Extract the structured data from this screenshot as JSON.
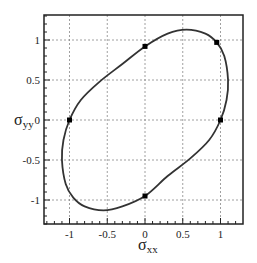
{
  "chart_data": {
    "type": "line",
    "title": "",
    "xlabel": "σxx",
    "ylabel": "σyy",
    "xlabel_main": "σ",
    "xlabel_sub": "xx",
    "ylabel_main": "σ",
    "ylabel_sub": "yy",
    "xlim": [
      -1.3,
      1.3
    ],
    "ylim": [
      -1.3,
      1.3
    ],
    "grid": true,
    "legend": null,
    "xticks": [
      -1,
      -0.5,
      0,
      0.5,
      1
    ],
    "xtick_labels": [
      "-1",
      "-0.5",
      "0",
      "0.5",
      "1"
    ],
    "yticks": [
      1,
      0.5,
      0,
      -0.5,
      -1
    ],
    "ytick_labels": [
      "1",
      "0.5",
      "0",
      "-0.5",
      "-1"
    ],
    "series": [
      {
        "name": "stress-ellipse",
        "kind": "closed-curve",
        "color": "#333333",
        "points": [
          [
            1.0,
            0.0
          ],
          [
            1.08,
            0.25
          ],
          [
            1.1,
            0.5
          ],
          [
            1.05,
            0.8
          ],
          [
            0.95,
            0.97
          ],
          [
            0.8,
            1.08
          ],
          [
            0.55,
            1.13
          ],
          [
            0.3,
            1.08
          ],
          [
            0.0,
            0.92
          ],
          [
            -0.3,
            0.7
          ],
          [
            -0.6,
            0.48
          ],
          [
            -0.85,
            0.25
          ],
          [
            -1.0,
            0.0
          ],
          [
            -1.08,
            -0.25
          ],
          [
            -1.1,
            -0.5
          ],
          [
            -1.05,
            -0.8
          ],
          [
            -0.95,
            -0.97
          ],
          [
            -0.8,
            -1.08
          ],
          [
            -0.55,
            -1.13
          ],
          [
            -0.3,
            -1.08
          ],
          [
            0.0,
            -0.95
          ],
          [
            0.3,
            -0.7
          ],
          [
            0.6,
            -0.48
          ],
          [
            0.85,
            -0.25
          ]
        ]
      },
      {
        "name": "marked-points",
        "kind": "markers",
        "marker": "square",
        "color": "#000000",
        "points": [
          [
            1.0,
            0.0
          ],
          [
            0.95,
            0.97
          ],
          [
            0.0,
            0.92
          ],
          [
            -1.0,
            0.0
          ],
          [
            0.0,
            -0.95
          ]
        ]
      }
    ]
  }
}
